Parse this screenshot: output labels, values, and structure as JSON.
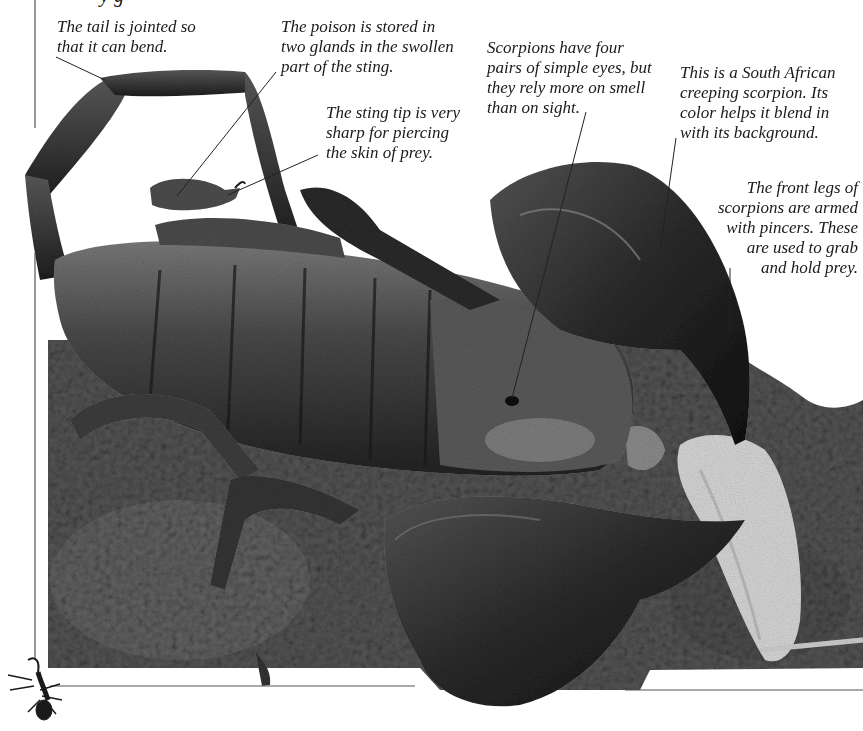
{
  "page": {
    "clipped_heading": "   y           g",
    "colors": {
      "background": "#ffffff",
      "text": "#1a1a1a",
      "frame_line": "#555555",
      "soil_dark": "#2a2a2a",
      "soil_mid": "#5c5c5c",
      "scorpion_body": "#3a3a3a",
      "scorpion_highlight": "#9a9a9a",
      "prey_pale": "#d8d8d8"
    }
  },
  "captions": [
    {
      "id": "tail",
      "text": "The tail is jointed so\nthat it can bend."
    },
    {
      "id": "poison",
      "text": "The poison is stored in\ntwo glands in the swollen\npart of the sting."
    },
    {
      "id": "sting-tip",
      "text": "The sting tip is very\nsharp for piercing\nthe skin of prey."
    },
    {
      "id": "eyes",
      "text": "Scorpions have four\npairs of simple eyes, but\nthey rely more on smell\nthan on sight."
    },
    {
      "id": "species",
      "text": "This is a South African\ncreeping scorpion. Its\ncolor helps it blend in\nwith its background."
    },
    {
      "id": "pincers",
      "text": "The front legs of\nscorpions are armed\nwith pincers. These\nare used to grab\nand hold prey."
    }
  ],
  "photo": {
    "subject": "South African creeping scorpion on soil holding prey",
    "style": "grayscale"
  },
  "icons": {
    "corner": "small-scorpion-icon"
  }
}
